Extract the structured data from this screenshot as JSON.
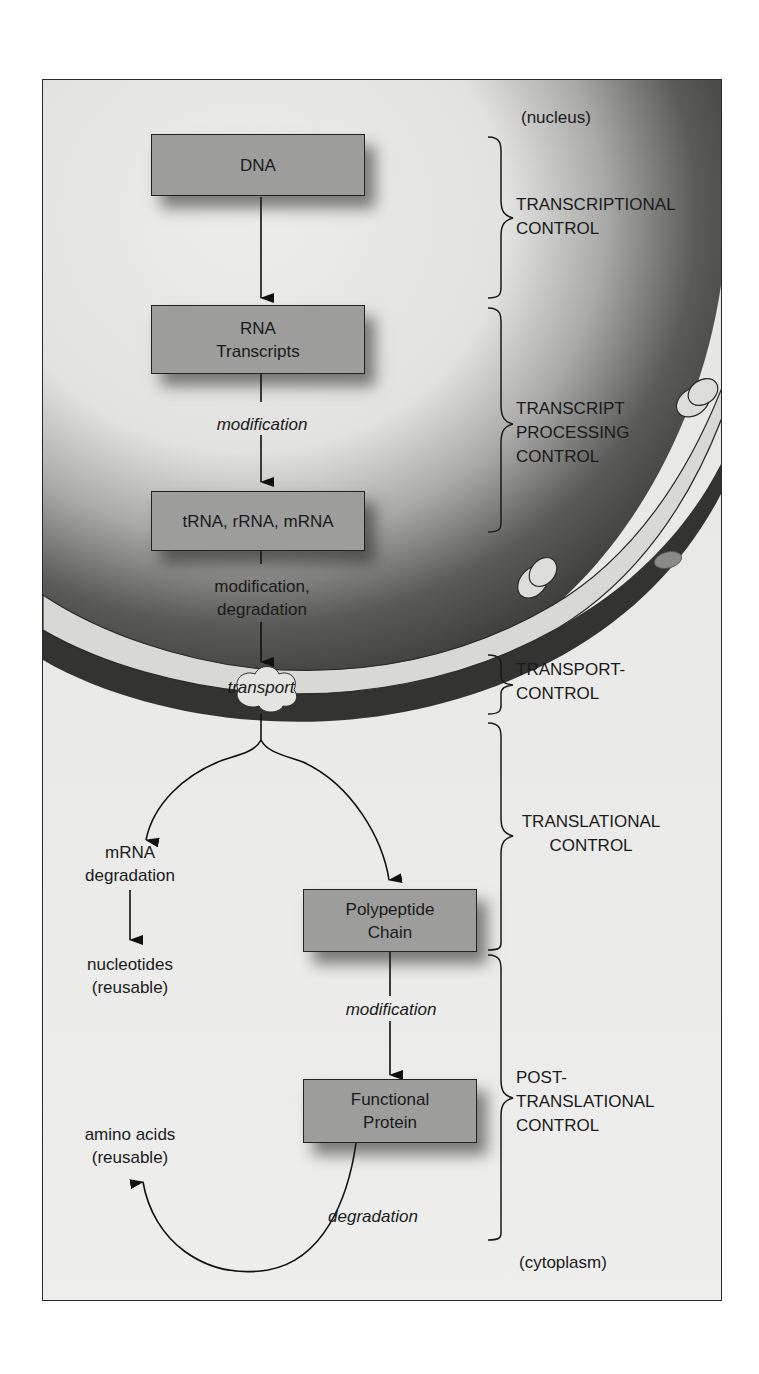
{
  "diagram": {
    "regions": {
      "nucleus": "(nucleus)",
      "cytoplasm": "(cytoplasm)"
    },
    "boxes": {
      "dna": {
        "line1": "DNA"
      },
      "rna": {
        "line1": "RNA",
        "line2": "Transcripts"
      },
      "trna": {
        "line1": "tRNA, rRNA, mRNA"
      },
      "polypeptide": {
        "line1": "Polypeptide",
        "line2": "Chain"
      },
      "protein": {
        "line1": "Functional",
        "line2": "Protein"
      }
    },
    "edge_labels": {
      "modification_1": "modification",
      "mod_deg_1": "modification,",
      "mod_deg_2": "degradation",
      "transport": "transport",
      "modification_2": "modification",
      "degradation": "degradation"
    },
    "side_nodes": {
      "mrna_deg_1": "mRNA",
      "mrna_deg_2": "degradation",
      "nucleotides_1": "nucleotides",
      "nucleotides_2": "(reusable)",
      "amino_1": "amino acids",
      "amino_2": "(reusable)"
    },
    "controls": {
      "transcriptional": {
        "line1": "TRANSCRIPTIONAL",
        "line2": "CONTROL"
      },
      "processing": {
        "line1": "TRANSCRIPT",
        "line2": "PROCESSING",
        "line3": "CONTROL"
      },
      "transport": {
        "line1": "TRANSPORT-",
        "line2": "CONTROL"
      },
      "translational": {
        "line1": "TRANSLATIONAL",
        "line2": "CONTROL"
      },
      "post": {
        "line1": "POST-",
        "line2": "TRANSLATIONAL",
        "line3": "CONTROL"
      }
    },
    "colors": {
      "box_fill": "#9d9d9b",
      "background_light": "#ececea",
      "nucleus_dark": "#3a3a3a",
      "membrane": "#d8d8d4"
    }
  }
}
